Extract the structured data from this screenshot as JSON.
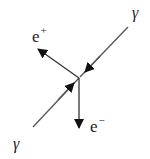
{
  "diagram": {
    "type": "feynman-like pair production schematic",
    "colors": {
      "line": "#555555",
      "arrow": "#111111",
      "text": "#222222",
      "background": "#ffffff"
    },
    "vertex": {
      "x": 79,
      "y": 78
    },
    "particles": [
      {
        "id": "gamma_in_upper",
        "symbol": "γ",
        "role": "incoming photon",
        "from": [
          128,
          27
        ],
        "to": [
          79,
          78
        ]
      },
      {
        "id": "gamma_in_lower",
        "symbol": "γ",
        "role": "incoming photon",
        "from": [
          33,
          127
        ],
        "to": [
          79,
          78
        ]
      },
      {
        "id": "positron",
        "symbol": "e",
        "charge": "+",
        "role": "outgoing positron",
        "from": [
          79,
          78
        ],
        "to": [
          38,
          49
        ]
      },
      {
        "id": "electron",
        "symbol": "e",
        "charge": "−",
        "role": "outgoing electron",
        "from": [
          79,
          78
        ],
        "to": [
          79,
          128
        ]
      }
    ],
    "labels": {
      "gamma_top": "γ",
      "gamma_bottom": "γ",
      "positron_base": "e",
      "positron_charge": "+",
      "electron_base": "e",
      "electron_charge": "−"
    }
  }
}
